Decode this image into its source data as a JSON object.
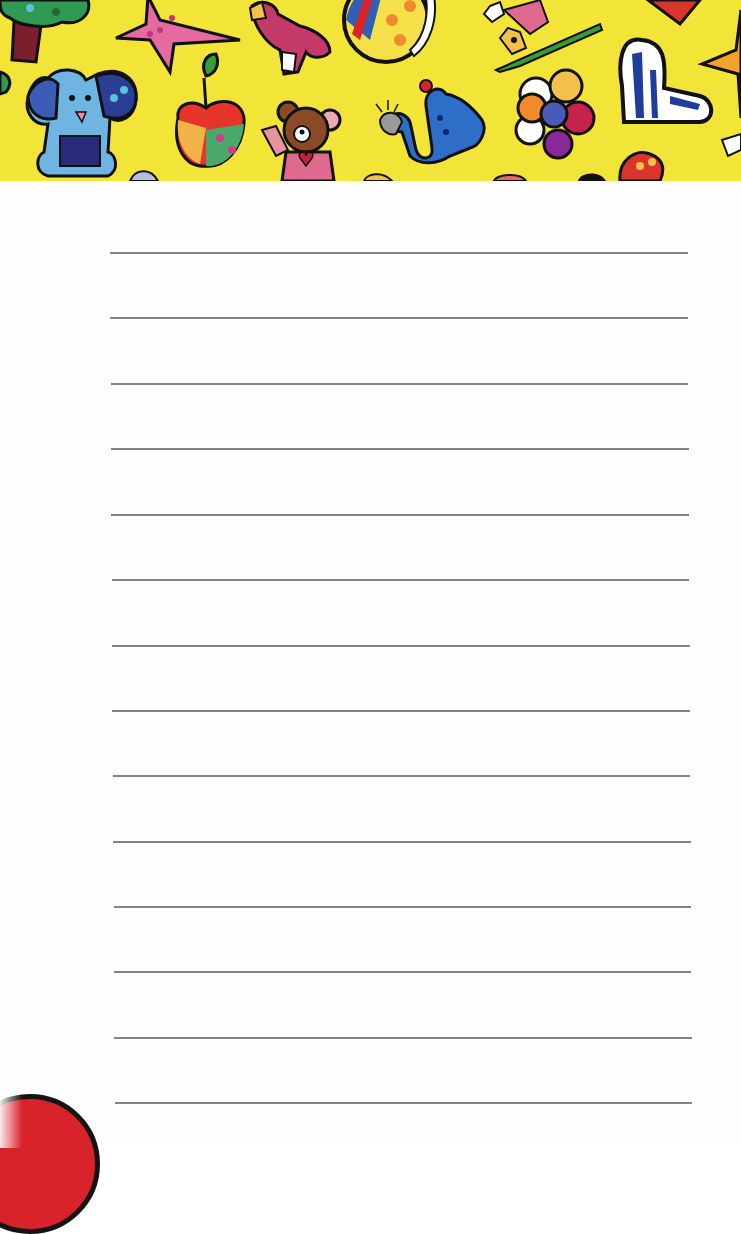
{
  "page": {
    "type": "lined notepad page",
    "banner": {
      "background_color": "#f2e538",
      "decorations": [
        "tree-icon",
        "star-icon",
        "bird-icon",
        "ball-icon",
        "alligator-icon",
        "heart-icon",
        "elephant-icon",
        "apple-icon",
        "teddy-bear-icon",
        "snake-icon",
        "flower-icon",
        "spotted-heart-icon",
        "orange-star-icon"
      ]
    },
    "paper": {
      "background_color": "#fefefe",
      "rule_color": "#6e6e6e",
      "rule_count": 14,
      "rules": [
        {
          "y": 253,
          "x1": 110,
          "x2": 688
        },
        {
          "y": 318,
          "x1": 110,
          "x2": 688
        },
        {
          "y": 384,
          "x1": 111,
          "x2": 688
        },
        {
          "y": 449,
          "x1": 111,
          "x2": 689
        },
        {
          "y": 515,
          "x1": 111,
          "x2": 689
        },
        {
          "y": 580,
          "x1": 112,
          "x2": 689
        },
        {
          "y": 646,
          "x1": 112,
          "x2": 690
        },
        {
          "y": 711,
          "x1": 112,
          "x2": 690
        },
        {
          "y": 776,
          "x1": 113,
          "x2": 690
        },
        {
          "y": 842,
          "x1": 113,
          "x2": 691
        },
        {
          "y": 907,
          "x1": 114,
          "x2": 691
        },
        {
          "y": 972,
          "x1": 114,
          "x2": 691
        },
        {
          "y": 1038,
          "x1": 114,
          "x2": 692
        },
        {
          "y": 1103,
          "x1": 115,
          "x2": 692
        }
      ]
    },
    "corner_decoration": {
      "name": "red-circle",
      "color": "#d9232a"
    }
  }
}
